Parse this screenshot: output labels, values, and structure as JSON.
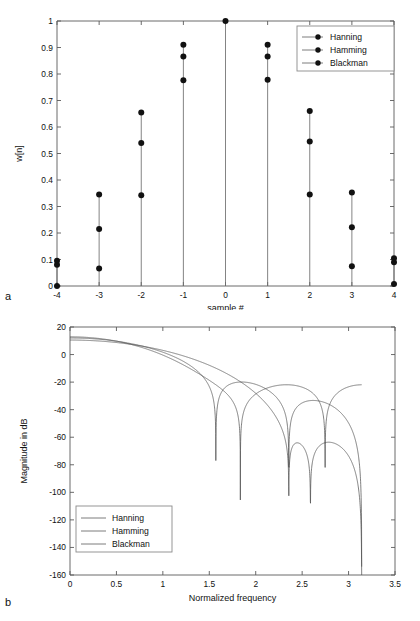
{
  "figure": {
    "panel_a_letter": "a",
    "panel_b_letter": "b"
  },
  "chart_data": [
    {
      "id": "window-coefficients",
      "type": "scatter",
      "title": "",
      "xlabel": "sample #",
      "ylabel": "w[n]",
      "xlim": [
        -4,
        4
      ],
      "ylim": [
        0,
        1
      ],
      "xticks": [
        "-4",
        "-3",
        "-2",
        "-1",
        "0",
        "1",
        "2",
        "3",
        "4"
      ],
      "xtickvals": [
        -4,
        -3,
        -2,
        -1,
        0,
        1,
        2,
        3,
        4
      ],
      "yticks": [
        "0",
        "0.1",
        "0.2",
        "0.3",
        "0.4",
        "0.5",
        "0.6",
        "0.7",
        "0.8",
        "0.9",
        "1"
      ],
      "ytickvals": [
        0,
        0.1,
        0.2,
        0.3,
        0.4,
        0.5,
        0.6,
        0.7,
        0.8,
        0.9,
        1
      ],
      "grid": false,
      "legend_position": "top-right",
      "legend_marker": "line-and-dot",
      "x": [
        -4,
        -3,
        -2,
        -1,
        0,
        1,
        2,
        3,
        4
      ],
      "series": [
        {
          "name": "Hanning",
          "values": [
            0.0,
            0.1464,
            0.5,
            0.8536,
            1.0,
            0.8536,
            0.5,
            0.1464,
            0.0
          ],
          "marker_values": [
            0.0,
            0.215,
            0.54,
            0.866,
            1.0,
            0.866,
            0.545,
            0.222,
            0.0
          ]
        },
        {
          "name": "Hamming",
          "values": [
            0.08,
            0.215,
            0.54,
            0.866,
            1.0,
            0.866,
            0.54,
            0.215,
            0.08
          ],
          "marker_values": [
            0.08,
            0.345,
            0.655,
            0.91,
            1.0,
            0.91,
            0.66,
            0.353,
            0.1
          ]
        },
        {
          "name": "Blackman",
          "values": [
            0.0,
            0.066,
            0.34,
            0.775,
            1.0,
            0.775,
            0.34,
            0.066,
            0.0
          ],
          "marker_values": [
            0.095,
            0.066,
            0.342,
            0.776,
            1.0,
            0.778,
            0.345,
            0.075,
            0.008
          ]
        }
      ],
      "stems": [
        {
          "x": -4,
          "markers": [
            0.0,
            0.08,
            0.095
          ]
        },
        {
          "x": -3,
          "markers": [
            0.066,
            0.215,
            0.345
          ]
        },
        {
          "x": -2,
          "markers": [
            0.342,
            0.54,
            0.655
          ]
        },
        {
          "x": -1,
          "markers": [
            0.776,
            0.866,
            0.91
          ]
        },
        {
          "x": 0,
          "markers": [
            1.0
          ]
        },
        {
          "x": 1,
          "markers": [
            0.778,
            0.866,
            0.91
          ]
        },
        {
          "x": 2,
          "markers": [
            0.345,
            0.545,
            0.66
          ]
        },
        {
          "x": 3,
          "markers": [
            0.075,
            0.222,
            0.353
          ]
        },
        {
          "x": 4,
          "markers": [
            0.008,
            0.09,
            0.105
          ]
        }
      ],
      "legend": [
        "Hanning",
        "Hamming",
        "Blackman"
      ]
    },
    {
      "id": "window-magnitude-response",
      "type": "line",
      "title": "",
      "xlabel": "Normalized frequency",
      "ylabel": "Magnitude in dB",
      "xlim": [
        0,
        3.5
      ],
      "ylim": [
        -160,
        20
      ],
      "xticks": [
        "0",
        "0.5",
        "1",
        "1.5",
        "2",
        "2.5",
        "3",
        "3.5"
      ],
      "xtickvals": [
        0,
        0.5,
        1,
        1.5,
        2,
        2.5,
        3,
        3.5
      ],
      "yticks": [
        "20",
        "0",
        "-20",
        "-40",
        "-60",
        "-80",
        "-100",
        "-120",
        "-140",
        "-160"
      ],
      "ytickvals": [
        20,
        0,
        -20,
        -40,
        -60,
        -80,
        -100,
        -120,
        -140,
        -160
      ],
      "grid": false,
      "legend_position": "center-left",
      "legend_marker": "line",
      "legend": [
        "Hanning",
        "Hamming",
        "Blackman"
      ],
      "series": [
        {
          "name": "Hanning",
          "peak_db": 6.0,
          "first_null_freq": 1.25,
          "first_null_db": -21,
          "sidelobe_peaks": [
            {
              "freq": 1.62,
              "db": -12.5
            },
            {
              "freq": 2.28,
              "db": -10.0
            },
            {
              "freq": 2.95,
              "db": -9.5
            }
          ],
          "nulls": [
            {
              "freq": 1.25,
              "db": -21
            },
            {
              "freq": 1.93,
              "db": -27
            },
            {
              "freq": 2.58,
              "db": -66
            },
            {
              "freq": 3.13,
              "db": -57
            }
          ]
        },
        {
          "name": "Hamming",
          "peak_db": 6.2,
          "first_null_freq": 1.85,
          "first_null_db": -23,
          "sidelobe_peaks": [
            {
              "freq": 2.07,
              "db": -14.0
            },
            {
              "freq": 2.73,
              "db": -18.5
            }
          ],
          "nulls": [
            {
              "freq": 1.85,
              "db": -23
            },
            {
              "freq": 2.36,
              "db": -160
            },
            {
              "freq": 3.12,
              "db": -45
            }
          ]
        },
        {
          "name": "Blackman",
          "peak_db": 6.4,
          "first_null_freq": 1.89,
          "first_null_db": -27,
          "sidelobe_peaks": [
            {
              "freq": 2.14,
              "db": -13.5
            },
            {
              "freq": 2.72,
              "db": -19.0
            }
          ],
          "nulls": [
            {
              "freq": 1.89,
              "db": -27
            },
            {
              "freq": 2.36,
              "db": -34
            },
            {
              "freq": 2.62,
              "db": -35
            }
          ]
        }
      ]
    }
  ],
  "panel_a": {
    "xlabel": "sample #",
    "ylabel": "w[n]",
    "legend": [
      "Hanning",
      "Hamming",
      "Blackman"
    ]
  },
  "panel_b": {
    "xlabel": "Normalized frequency",
    "ylabel": "Magnitude in dB",
    "legend": [
      "Hanning",
      "Hamming",
      "Blackman"
    ]
  }
}
